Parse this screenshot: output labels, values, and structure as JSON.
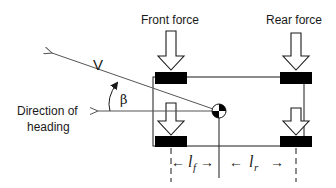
{
  "diagram": {
    "labels": {
      "front_force": "Front force",
      "rear_force": "Rear force",
      "velocity": "V",
      "slip_angle": "β",
      "heading_line1": "Direction of",
      "heading_line2": "heading",
      "lf_main": "l",
      "lf_sub": "f",
      "lr_main": "l",
      "lr_sub": "r",
      "arrow_left": "←",
      "arrow_right": "→"
    },
    "colors": {
      "stroke": "#1a1a1a",
      "wheel": "#000000",
      "background": "#ffffff",
      "thin_line": "#666666"
    }
  }
}
